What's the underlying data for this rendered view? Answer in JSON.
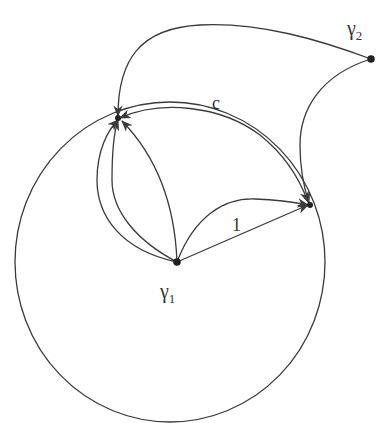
{
  "diagram": {
    "type": "graph on surface",
    "stroke_color": "#3a3a3a",
    "background": "#ffffff",
    "circle": {
      "cx": 170,
      "cy": 262,
      "rx": 155,
      "ry": 160
    },
    "nodes": [
      {
        "id": "gamma1",
        "label": "γ",
        "subscript": "1",
        "x": 177,
        "y": 262
      },
      {
        "id": "gamma2",
        "label": "γ",
        "subscript": "2",
        "x": 371,
        "y": 59
      },
      {
        "id": "p1",
        "label": "",
        "x": 118,
        "y": 118
      },
      {
        "id": "p2",
        "label": "",
        "x": 310,
        "y": 205
      }
    ],
    "edge_labels": {
      "c": "c",
      "one": "1"
    },
    "edges": [
      {
        "from": "gamma2",
        "to": "p1",
        "arrow": "end"
      },
      {
        "from": "gamma2",
        "to": "p2",
        "arrow": "end"
      },
      {
        "from": "p1",
        "to": "p2",
        "label": "c",
        "arrow": "both"
      },
      {
        "from": "gamma1",
        "to": "p2",
        "label": "1",
        "arrow": "end",
        "shape": "straight"
      },
      {
        "from": "gamma1",
        "to": "p2",
        "arrow": "end",
        "shape": "arc"
      },
      {
        "from": "gamma1",
        "to": "p1",
        "arrow": "end",
        "shape": "arc-left-outer"
      },
      {
        "from": "gamma1",
        "to": "p1",
        "arrow": "end",
        "shape": "arc-left-inner"
      },
      {
        "from": "gamma1",
        "to": "p1",
        "arrow": "end",
        "shape": "arc-right"
      }
    ]
  }
}
